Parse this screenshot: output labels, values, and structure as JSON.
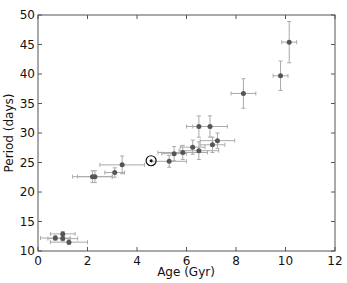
{
  "chart_data": {
    "type": "scatter",
    "title": "",
    "xlabel": "Age (Gyr)",
    "ylabel": "Period (days)",
    "xlim": [
      0,
      12
    ],
    "ylim": [
      10,
      50
    ],
    "xticks": [
      0,
      2,
      4,
      6,
      8,
      10,
      12
    ],
    "yticks": [
      10,
      15,
      20,
      25,
      30,
      35,
      40,
      45,
      50
    ],
    "grid": false,
    "legend": null,
    "marker_color": "#555555",
    "errorbar_color": "#aaaaaa",
    "series": [
      {
        "name": "stars",
        "points": [
          {
            "x": 0.7,
            "y": 12.2,
            "xerr": 0.6,
            "yerr": 0.4
          },
          {
            "x": 1.0,
            "y": 12.9,
            "xerr": 0.5,
            "yerr": 0.4
          },
          {
            "x": 1.0,
            "y": 12.1,
            "xerr": 0.6,
            "yerr": 0.4
          },
          {
            "x": 1.25,
            "y": 11.5,
            "xerr": 0.75,
            "yerr": 0.4
          },
          {
            "x": 2.2,
            "y": 22.6,
            "xerr": 0.8,
            "yerr": 1.0
          },
          {
            "x": 2.3,
            "y": 22.6,
            "xerr": 0.7,
            "yerr": 1.0
          },
          {
            "x": 3.1,
            "y": 23.3,
            "xerr": 0.4,
            "yerr": 0.8
          },
          {
            "x": 3.4,
            "y": 24.6,
            "xerr": 0.9,
            "yerr": 1.5
          },
          {
            "x": 5.3,
            "y": 25.2,
            "xerr": 0.7,
            "yerr": 1.0
          },
          {
            "x": 5.5,
            "y": 26.5,
            "xerr": 0.5,
            "yerr": 1.2
          },
          {
            "x": 5.85,
            "y": 26.7,
            "xerr": 1.0,
            "yerr": 1.2
          },
          {
            "x": 6.25,
            "y": 27.6,
            "xerr": 0.5,
            "yerr": 1.2
          },
          {
            "x": 6.5,
            "y": 27.0,
            "xerr": 0.8,
            "yerr": 1.5
          },
          {
            "x": 6.5,
            "y": 31.1,
            "xerr": 0.5,
            "yerr": 1.8
          },
          {
            "x": 6.95,
            "y": 31.1,
            "xerr": 0.7,
            "yerr": 1.8
          },
          {
            "x": 7.05,
            "y": 28.0,
            "xerr": 0.5,
            "yerr": 1.3
          },
          {
            "x": 7.25,
            "y": 28.7,
            "xerr": 0.7,
            "yerr": 1.3
          },
          {
            "x": 8.3,
            "y": 36.7,
            "xerr": 0.5,
            "yerr": 2.5
          },
          {
            "x": 9.8,
            "y": 39.7,
            "xerr": 0.3,
            "yerr": 2.5
          },
          {
            "x": 10.15,
            "y": 45.4,
            "xerr": 0.3,
            "yerr": 3.5
          }
        ]
      },
      {
        "name": "Sun",
        "marker": "sun-symbol",
        "points": [
          {
            "x": 4.57,
            "y": 25.3,
            "xerr": 0,
            "yerr": 0
          }
        ]
      }
    ]
  }
}
